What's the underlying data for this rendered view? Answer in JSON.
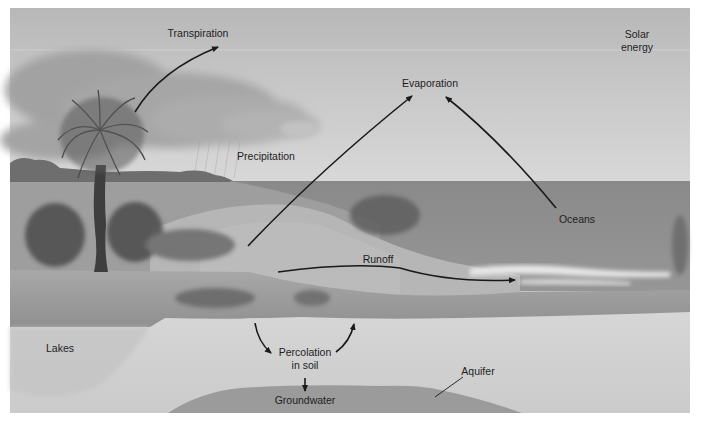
{
  "diagram": {
    "style": "grayscale illustration",
    "colors": {
      "sky_top": "#b9b9b9",
      "sky_bottom": "#d6d6d6",
      "ocean": "#8e8e8e",
      "land_light": "#b4b4b4",
      "lake": "#9a9a9a",
      "soil": "#d2d2d2",
      "groundwater": "#9b9b9b",
      "arrow": "#1a1a1a",
      "text": "#1e1e1e"
    },
    "labels": {
      "transpiration": "Transpiration",
      "solar_line1": "Solar",
      "solar_line2": "energy",
      "evaporation": "Evaporation",
      "precipitation": "Precipitation",
      "oceans": "Oceans",
      "runoff": "Runoff",
      "lakes": "Lakes",
      "percolation_line1": "Percolation",
      "percolation_line2": "in soil",
      "aquifer": "Aquifer",
      "groundwater": "Groundwater"
    },
    "arrows": [
      {
        "from": "palm-tree",
        "to": "Transpiration"
      },
      {
        "from": "land",
        "to": "Evaporation"
      },
      {
        "from": "Oceans",
        "to": "Evaporation"
      },
      {
        "from": "land",
        "to": "ocean",
        "label": "Runoff"
      },
      {
        "from": "surface",
        "to": "Percolation in soil"
      },
      {
        "from": "Percolation in soil",
        "to": "surface"
      },
      {
        "from": "Percolation in soil",
        "to": "Groundwater"
      }
    ]
  }
}
